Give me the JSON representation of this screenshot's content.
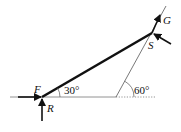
{
  "diagram": {
    "type": "force-diagram",
    "labels": {
      "F": "F",
      "R": "R",
      "S": "S",
      "G": "G",
      "angle_rod": "30°",
      "angle_support": "60°"
    },
    "colors": {
      "ink": "#111111",
      "thin": "#555555"
    }
  }
}
